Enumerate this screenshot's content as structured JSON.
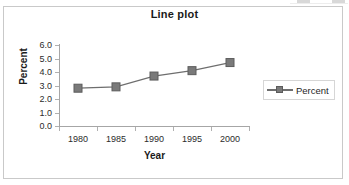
{
  "chart_data": {
    "type": "line",
    "title": "Line plot",
    "xlabel": "Year",
    "ylabel": "Percent",
    "categories": [
      "1980",
      "1985",
      "1990",
      "1995",
      "2000"
    ],
    "x": [
      1980,
      1985,
      1990,
      1995,
      2000
    ],
    "series": [
      {
        "name": "Percent",
        "values": [
          2.8,
          2.9,
          3.7,
          4.1,
          4.7
        ]
      }
    ],
    "ylim": [
      0.0,
      6.0
    ],
    "ytick_labels": [
      "6.0",
      "5.0",
      "4.0",
      "3.0",
      "2.0",
      "1.0",
      "0.0"
    ],
    "ytick_values": [
      6.0,
      5.0,
      4.0,
      3.0,
      2.0,
      1.0,
      0.0
    ],
    "xtick_labels": [
      "1980",
      "1985",
      "1990",
      "1995",
      "2000"
    ],
    "grid": false,
    "legend": {
      "position": "right",
      "entries": [
        "Percent"
      ]
    },
    "marker": "square",
    "colors": {
      "series_line": "#6e6e6e",
      "series_marker": "#7a7a7a",
      "marker_edge": "#5c5c5c",
      "axis": "#a6a6a6",
      "frame": "#c9c9c9",
      "text": "#1a1a1a"
    }
  }
}
